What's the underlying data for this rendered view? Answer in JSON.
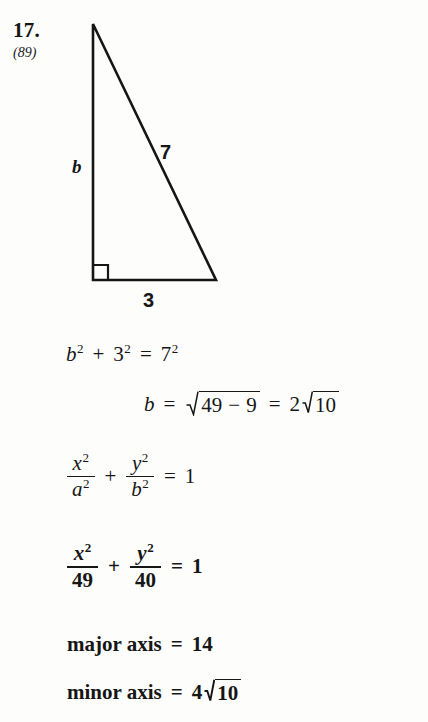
{
  "problem": {
    "number": "17.",
    "reference": "(89)"
  },
  "figure": {
    "name": "right-triangle",
    "labels": {
      "vertical_leg": "b",
      "hypotenuse": "7",
      "horizontal_leg": "3"
    },
    "right_angle_marker": true,
    "stroke_color": "#161616"
  },
  "work": {
    "line1": {
      "lhs_base": "b",
      "lhs_exp": "2",
      "plus": "+",
      "mid_base": "3",
      "mid_exp": "2",
      "equals": "=",
      "rhs_base": "7",
      "rhs_exp": "2"
    },
    "line2": {
      "var": "b",
      "equals1": "=",
      "radicand_a": "49",
      "minus": "−",
      "radicand_b": "9",
      "equals2": "=",
      "coefficient": "2",
      "root_value": "10"
    },
    "line3": {
      "num1": "x",
      "num1_exp": "2",
      "den1": "a",
      "den1_exp": "2",
      "plus": "+",
      "num2": "y",
      "num2_exp": "2",
      "den2": "b",
      "den2_exp": "2",
      "equals": "=",
      "rhs": "1"
    },
    "line4": {
      "num1": "x",
      "num1_exp": "2",
      "den1": "49",
      "plus": "+",
      "num2": "y",
      "num2_exp": "2",
      "den2": "40",
      "equals": "=",
      "rhs": "1"
    },
    "line5": {
      "label": "major axis",
      "equals": "=",
      "value": "14"
    },
    "line6": {
      "label": "minor axis",
      "equals": "=",
      "coefficient": "4",
      "root_value": "10"
    }
  }
}
